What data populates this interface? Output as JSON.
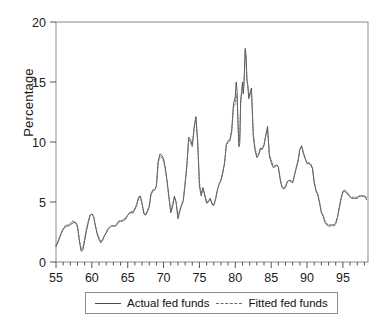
{
  "chart_data": {
    "type": "line",
    "title": "",
    "xlabel": "",
    "ylabel": "Percentage",
    "xlim": [
      55,
      98.5
    ],
    "ylim": [
      0,
      20
    ],
    "yticks": [
      0,
      5,
      10,
      15,
      20
    ],
    "xticks": [
      55,
      60,
      65,
      70,
      75,
      80,
      85,
      90,
      95
    ],
    "xtick_labels": [
      "55",
      "60",
      "65",
      "70",
      "75",
      "80",
      "85",
      "90",
      "95"
    ],
    "ytick_labels": [
      "0",
      "5",
      "10",
      "15",
      "20"
    ],
    "minor_xtick_step": 1,
    "grid": false,
    "legend_position": "below-center",
    "x_unit": "year (19xx)",
    "x": [
      55.0,
      55.25,
      55.5,
      55.75,
      56.0,
      56.25,
      56.5,
      56.75,
      57.0,
      57.25,
      57.5,
      57.75,
      58.0,
      58.25,
      58.5,
      58.75,
      59.0,
      59.25,
      59.5,
      59.75,
      60.0,
      60.25,
      60.5,
      60.75,
      61.0,
      61.25,
      61.5,
      61.75,
      62.0,
      62.25,
      62.5,
      62.75,
      63.0,
      63.25,
      63.5,
      63.75,
      64.0,
      64.25,
      64.5,
      64.75,
      65.0,
      65.25,
      65.5,
      65.75,
      66.0,
      66.25,
      66.5,
      66.75,
      67.0,
      67.25,
      67.5,
      67.75,
      68.0,
      68.25,
      68.5,
      68.75,
      69.0,
      69.25,
      69.5,
      69.75,
      70.0,
      70.25,
      70.5,
      70.75,
      71.0,
      71.25,
      71.5,
      71.75,
      72.0,
      72.25,
      72.5,
      72.75,
      73.0,
      73.25,
      73.5,
      73.75,
      74.0,
      74.25,
      74.5,
      74.75,
      75.0,
      75.25,
      75.5,
      75.75,
      76.0,
      76.25,
      76.5,
      76.75,
      77.0,
      77.25,
      77.5,
      77.75,
      78.0,
      78.25,
      78.5,
      78.75,
      79.0,
      79.25,
      79.5,
      79.75,
      80.0,
      80.125,
      80.25,
      80.375,
      80.5,
      80.625,
      80.75,
      80.875,
      81.0,
      81.125,
      81.25,
      81.375,
      81.5,
      81.625,
      81.75,
      81.875,
      82.0,
      82.25,
      82.5,
      82.75,
      83.0,
      83.25,
      83.5,
      83.75,
      84.0,
      84.25,
      84.5,
      84.75,
      85.0,
      85.25,
      85.5,
      85.75,
      86.0,
      86.25,
      86.5,
      86.75,
      87.0,
      87.25,
      87.5,
      87.75,
      88.0,
      88.25,
      88.5,
      88.75,
      89.0,
      89.25,
      89.5,
      89.75,
      90.0,
      90.25,
      90.5,
      90.75,
      91.0,
      91.25,
      91.5,
      91.75,
      92.0,
      92.25,
      92.5,
      92.75,
      93.0,
      93.25,
      93.5,
      93.75,
      94.0,
      94.25,
      94.5,
      94.75,
      95.0,
      95.25,
      95.5,
      95.75,
      96.0,
      96.25,
      96.5,
      96.75,
      97.0,
      97.25,
      97.5,
      97.75,
      98.0,
      98.3
    ],
    "series": [
      {
        "name": "Actual fed funds",
        "style": "solid",
        "color": "#4a4a4a",
        "values": [
          1.3,
          1.6,
          2.0,
          2.4,
          2.7,
          2.9,
          3.0,
          3.0,
          3.1,
          3.2,
          3.3,
          3.3,
          3.0,
          1.8,
          0.9,
          1.0,
          1.8,
          2.6,
          3.3,
          3.9,
          4.0,
          3.8,
          3.0,
          2.3,
          1.9,
          1.6,
          1.8,
          2.2,
          2.4,
          2.7,
          2.9,
          3.0,
          3.0,
          3.0,
          3.1,
          3.4,
          3.4,
          3.4,
          3.5,
          3.6,
          3.9,
          4.1,
          4.1,
          4.1,
          4.4,
          4.7,
          5.4,
          5.5,
          4.9,
          4.0,
          3.9,
          4.2,
          4.6,
          5.7,
          6.0,
          6.0,
          6.3,
          8.4,
          9.0,
          8.9,
          8.6,
          7.8,
          6.7,
          5.4,
          4.1,
          4.6,
          5.5,
          5.0,
          3.6,
          4.2,
          4.7,
          5.1,
          6.5,
          8.0,
          10.4,
          10.2,
          9.7,
          11.2,
          12.1,
          10.0,
          6.3,
          5.5,
          6.2,
          5.5,
          4.9,
          5.0,
          5.3,
          4.8,
          4.7,
          5.2,
          6.0,
          6.5,
          6.8,
          7.4,
          8.2,
          9.8,
          10.1,
          10.2,
          11.0,
          13.2,
          13.8,
          15.0,
          14.2,
          11.4,
          9.6,
          9.9,
          13.5,
          14.2,
          15.0,
          14.0,
          15.5,
          17.8,
          17.2,
          15.1,
          14.7,
          13.6,
          14.0,
          14.5,
          10.5,
          9.3,
          8.7,
          8.9,
          9.5,
          9.4,
          9.7,
          10.6,
          11.3,
          8.8,
          8.3,
          7.9,
          7.9,
          8.1,
          7.9,
          6.9,
          6.2,
          6.1,
          6.2,
          6.7,
          6.8,
          6.7,
          6.6,
          7.2,
          7.8,
          8.4,
          9.4,
          9.7,
          9.1,
          8.6,
          8.2,
          8.2,
          8.1,
          7.8,
          6.6,
          5.9,
          5.6,
          4.9,
          4.1,
          3.8,
          3.3,
          3.1,
          3.0,
          3.0,
          3.1,
          3.0,
          3.2,
          3.7,
          4.5,
          5.3,
          5.9,
          6.0,
          5.8,
          5.7,
          5.4,
          5.3,
          5.3,
          5.3,
          5.3,
          5.5,
          5.5,
          5.5,
          5.5,
          5.2
        ]
      },
      {
        "name": "Fitted fed funds",
        "style": "dotted",
        "color": "#6a6a6a",
        "values": [
          1.4,
          1.7,
          2.1,
          2.5,
          2.8,
          3.0,
          3.1,
          3.1,
          3.2,
          3.4,
          3.4,
          3.2,
          2.9,
          1.9,
          1.1,
          1.2,
          2.0,
          2.8,
          3.4,
          3.9,
          4.0,
          3.7,
          3.0,
          2.4,
          2.0,
          1.7,
          1.9,
          2.2,
          2.5,
          2.8,
          2.9,
          3.0,
          3.0,
          3.0,
          3.2,
          3.4,
          3.4,
          3.5,
          3.6,
          3.7,
          3.9,
          4.1,
          4.2,
          4.2,
          4.5,
          4.8,
          5.3,
          5.4,
          4.8,
          4.1,
          4.0,
          4.3,
          4.7,
          5.6,
          5.9,
          6.0,
          6.4,
          8.3,
          8.8,
          8.7,
          8.4,
          7.7,
          6.6,
          5.3,
          4.3,
          4.8,
          5.4,
          4.9,
          3.9,
          4.3,
          4.8,
          5.2,
          6.6,
          8.2,
          10.2,
          10.0,
          9.6,
          11.0,
          12.1,
          10.2,
          6.6,
          5.7,
          6.2,
          5.6,
          5.0,
          5.1,
          5.3,
          4.9,
          4.8,
          5.3,
          6.0,
          6.5,
          6.9,
          7.5,
          8.3,
          9.7,
          10.0,
          10.1,
          10.8,
          12.9,
          13.2,
          14.0,
          13.6,
          11.8,
          10.0,
          10.4,
          13.2,
          13.9,
          14.6,
          14.3,
          15.2,
          17.5,
          16.9,
          15.2,
          14.6,
          13.9,
          13.8,
          14.2,
          10.8,
          9.5,
          8.9,
          9.0,
          9.4,
          9.4,
          9.8,
          10.5,
          11.0,
          9.0,
          8.5,
          8.1,
          8.0,
          8.1,
          7.9,
          7.0,
          6.3,
          6.2,
          6.3,
          6.7,
          6.8,
          6.8,
          6.7,
          7.3,
          7.9,
          8.5,
          9.4,
          9.6,
          9.0,
          8.6,
          8.3,
          8.3,
          8.2,
          7.9,
          6.7,
          6.0,
          5.7,
          5.0,
          4.2,
          3.9,
          3.4,
          3.2,
          3.1,
          3.1,
          3.1,
          3.1,
          3.3,
          3.8,
          4.6,
          5.3,
          5.8,
          5.9,
          5.7,
          5.6,
          5.4,
          5.4,
          5.4,
          5.4,
          5.4,
          5.5,
          5.5,
          5.5,
          5.5,
          5.4
        ]
      }
    ]
  },
  "legend": {
    "items": [
      {
        "label": "Actual fed funds",
        "style": "solid"
      },
      {
        "label": "Fitted fed funds",
        "style": "dotted"
      }
    ]
  },
  "axis": {
    "y_title": "Percentage"
  }
}
